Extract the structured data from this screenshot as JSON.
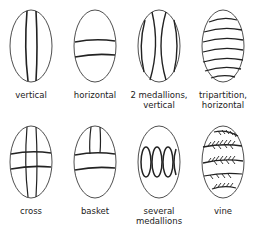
{
  "diagram": {
    "title": "",
    "stroke_color": "#222222",
    "row1": [
      {
        "id": "vertical",
        "label": "vertical"
      },
      {
        "id": "horizontal",
        "label": "horizontal"
      },
      {
        "id": "two-medallions",
        "label": "2 medallions,\nvertical"
      },
      {
        "id": "tripartition",
        "label": "tripartition,\nhorizontal"
      }
    ],
    "row2": [
      {
        "id": "cross",
        "label": "cross"
      },
      {
        "id": "basket",
        "label": "basket"
      },
      {
        "id": "several-medallions",
        "label": "several\nmedallions"
      },
      {
        "id": "vine",
        "label": "vine"
      }
    ]
  }
}
